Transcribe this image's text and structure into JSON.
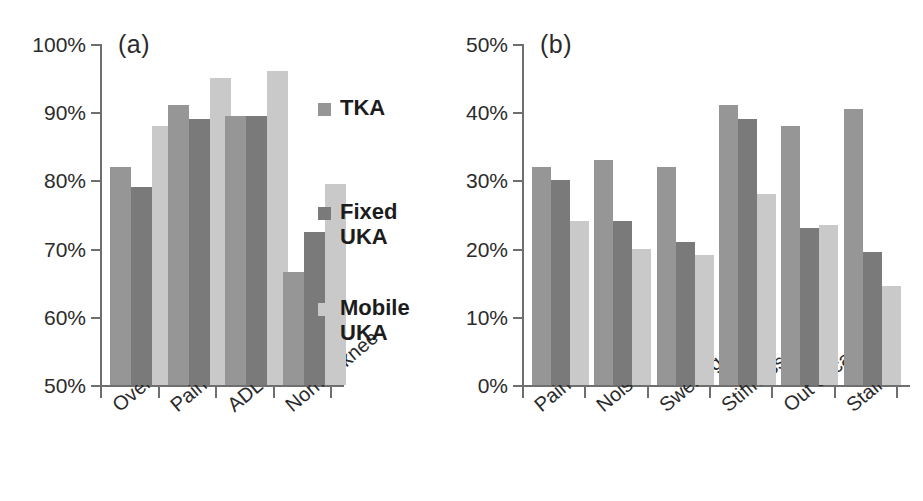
{
  "figure": {
    "panel_a_label": "(a)",
    "panel_b_label": "(b)"
  },
  "legend": {
    "position": "center-right of panel (a)",
    "items": [
      {
        "label": "TKA",
        "color": "#969696"
      },
      {
        "label": "Fixed\nUKA",
        "color": "#7a7a7a"
      },
      {
        "label": "Mobile\nUKA",
        "color": "#c9c9c9"
      }
    ]
  },
  "chart_data": [
    {
      "id": "panel-a",
      "type": "bar",
      "title": "(a)",
      "xlabel": "",
      "ylabel": "",
      "ylim": [
        50,
        100
      ],
      "ytick_labels": [
        "100%",
        "90%",
        "80%",
        "70%",
        "60%",
        "50%"
      ],
      "ytick_values": [
        100,
        90,
        80,
        70,
        60,
        50
      ],
      "grid": false,
      "legend": [
        "TKA",
        "Fixed UKA",
        "Mobile UKA"
      ],
      "legend_position": "right",
      "categories": [
        "Overall",
        "Pain",
        "ADL",
        "Normal knee"
      ],
      "series": [
        {
          "name": "TKA",
          "color": "#969696",
          "values": [
            82,
            91,
            89.5,
            66.5
          ]
        },
        {
          "name": "Fixed UKA",
          "color": "#7a7a7a",
          "values": [
            79,
            89,
            89.5,
            72.5
          ]
        },
        {
          "name": "Mobile UKA",
          "color": "#c9c9c9",
          "values": [
            88,
            95,
            96,
            79.5
          ]
        }
      ]
    },
    {
      "id": "panel-b",
      "type": "bar",
      "title": "(b)",
      "xlabel": "",
      "ylabel": "",
      "ylim": [
        0,
        50
      ],
      "ytick_labels": [
        "50%",
        "40%",
        "30%",
        "20%",
        "10%",
        "0%"
      ],
      "ytick_values": [
        50,
        40,
        30,
        20,
        10,
        0
      ],
      "grid": false,
      "legend": [
        "TKA",
        "Fixed UKA",
        "Mobile UKA"
      ],
      "legend_position": "none",
      "categories": [
        "Pain",
        "Noise",
        "Swelling",
        "Stiffness",
        "Out of car",
        "Stairs"
      ],
      "series": [
        {
          "name": "TKA",
          "color": "#969696",
          "values": [
            32,
            33,
            32,
            41,
            38,
            40.5
          ]
        },
        {
          "name": "Fixed UKA",
          "color": "#7a7a7a",
          "values": [
            30,
            24,
            21,
            39,
            23,
            19.5
          ]
        },
        {
          "name": "Mobile UKA",
          "color": "#c9c9c9",
          "values": [
            24,
            20,
            19,
            28,
            23.5,
            14.5
          ]
        }
      ]
    }
  ]
}
